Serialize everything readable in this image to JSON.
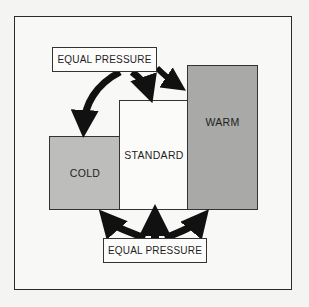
{
  "diagram": {
    "labels": {
      "top": "EQUAL PRESSURE",
      "bottom": "EQUAL PRESSURE"
    },
    "columns": [
      {
        "name": "cold",
        "label": "COLD",
        "color": "#bdbdbb"
      },
      {
        "name": "standard",
        "label": "STANDARD",
        "color": "#fbfbfa"
      },
      {
        "name": "warm",
        "label": "WARM",
        "color": "#a9a9a7"
      }
    ],
    "arrows": {
      "top": [
        "equal-pressure-to-cold-top",
        "equal-pressure-to-standard-top",
        "equal-pressure-to-warm-top"
      ],
      "bottom": [
        "equal-pressure-to-cold-bottom",
        "equal-pressure-to-standard-bottom",
        "equal-pressure-to-warm-bottom"
      ],
      "color": "#111111"
    }
  }
}
